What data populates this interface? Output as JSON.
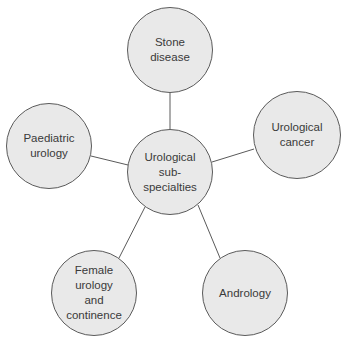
{
  "diagram": {
    "type": "hub-and-spoke",
    "center": {
      "label": "Urological\nsub-\nspecialties",
      "cx": 170,
      "cy": 172,
      "r": 43
    },
    "nodes": [
      {
        "id": "stone",
        "label": "Stone\ndisease",
        "cx": 170,
        "cy": 50,
        "r": 43
      },
      {
        "id": "cancer",
        "label": "Urological\ncancer",
        "cx": 297,
        "cy": 135,
        "r": 44
      },
      {
        "id": "andrology",
        "label": "Andrology",
        "cx": 245,
        "cy": 293,
        "r": 43
      },
      {
        "id": "female",
        "label": "Female\nurology\nand\ncontinence",
        "cx": 94,
        "cy": 293,
        "r": 43
      },
      {
        "id": "paediatric",
        "label": "Paediatric\nurology",
        "cx": 49,
        "cy": 146,
        "r": 43
      }
    ],
    "colors": {
      "fill": "#e9e9e9",
      "stroke": "#5a5a5a",
      "text": "#3a3a3a"
    }
  }
}
